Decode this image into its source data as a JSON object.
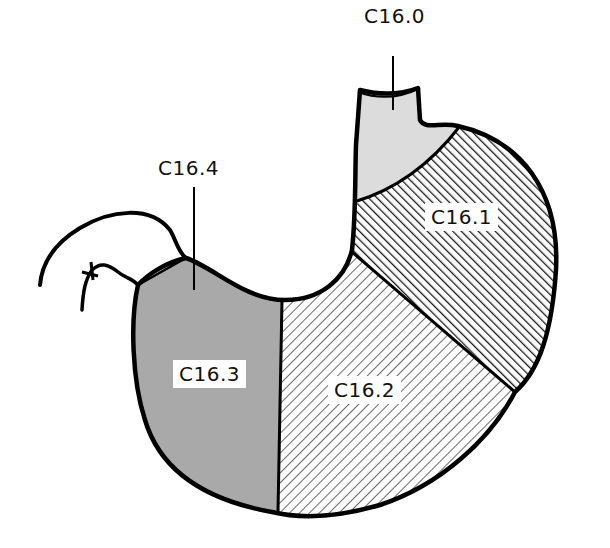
{
  "figure": {
    "regions": [
      {
        "code": "C16.0",
        "fill": "light-gray-stipple",
        "color": "#d9d9d9"
      },
      {
        "code": "C16.1",
        "fill": "dense-diagonal-hatch",
        "color": "#222222"
      },
      {
        "code": "C16.2",
        "fill": "sparse-diagonal-hatch",
        "color": "#555555"
      },
      {
        "code": "C16.3",
        "fill": "medium-gray-stipple",
        "color": "#a6a6a6"
      },
      {
        "code": "C16.4",
        "fill": "none",
        "color": "#a6a6a6"
      }
    ],
    "labels": {
      "c160": "C16.0",
      "c161": "C16.1",
      "c162": "C16.2",
      "c163": "C16.3",
      "c164": "C16.4"
    },
    "outline_color": "#000000",
    "background": "#ffffff"
  }
}
